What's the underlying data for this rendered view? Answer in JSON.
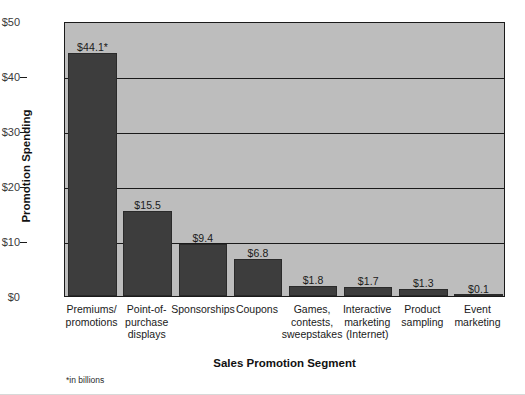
{
  "chart_data": {
    "type": "bar",
    "title": "",
    "xlabel": "Sales Promotion Segment",
    "ylabel": "Promotion Spending",
    "ylim": [
      0,
      50
    ],
    "yticks": [
      0,
      10,
      20,
      30,
      40,
      50
    ],
    "ytick_labels": [
      "$0",
      "$10",
      "$20",
      "$30",
      "$40",
      "$50"
    ],
    "grid": true,
    "legend": false,
    "footnote": "*in billions",
    "bar_color": "#3d3d3d",
    "plot_background": "#bdbdbd",
    "categories": [
      "Premiums/ promotions",
      "Point-of- purchase displays",
      "Sponsorships",
      "Coupons",
      "Games, contests, sweepstakes",
      "Interactive marketing (Internet)",
      "Product sampling",
      "Event marketing"
    ],
    "category_lines": [
      [
        "Premiums/",
        "promotions"
      ],
      [
        "Point-of-",
        "purchase",
        "displays"
      ],
      [
        "Sponsorships"
      ],
      [
        "Coupons"
      ],
      [
        "Games,",
        "contests,",
        "sweepstakes"
      ],
      [
        "Interactive",
        "marketing",
        "(Internet)"
      ],
      [
        "Product",
        "sampling"
      ],
      [
        "Event",
        "marketing"
      ]
    ],
    "values": [
      44.1,
      15.5,
      9.4,
      6.8,
      1.8,
      1.7,
      1.3,
      0.1
    ],
    "value_labels": [
      "$44.1*",
      "$15.5",
      "$9.4",
      "$6.8",
      "$1.8",
      "$1.7",
      "$1.3",
      "$0.1"
    ]
  }
}
